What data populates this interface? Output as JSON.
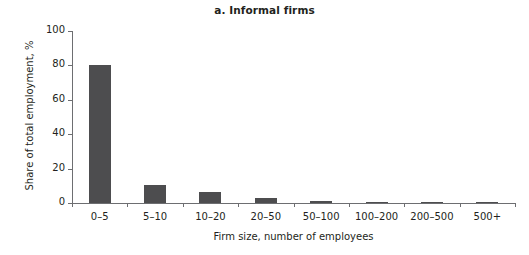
{
  "chart_data": {
    "type": "bar",
    "title": "a. Informal firms",
    "xlabel": "Firm size, number of employees",
    "ylabel": "Share of total employment, %",
    "categories": [
      "0–5",
      "5–10",
      "10–20",
      "20–50",
      "50–100",
      "100–200",
      "200–500",
      "500+"
    ],
    "values": [
      80,
      10.5,
      6.4,
      2.9,
      1.0,
      0.7,
      0.2,
      0.1
    ],
    "ylim": [
      0,
      100
    ],
    "yticks": [
      0,
      20,
      40,
      60,
      80,
      100
    ],
    "ytick_labels": [
      "0",
      "20",
      "40",
      "60",
      "80",
      "100"
    ],
    "grid": false,
    "legend": null,
    "bar_color": "#4d4d4f",
    "axis_color": "#6d6e71",
    "background": "#ffffff"
  }
}
